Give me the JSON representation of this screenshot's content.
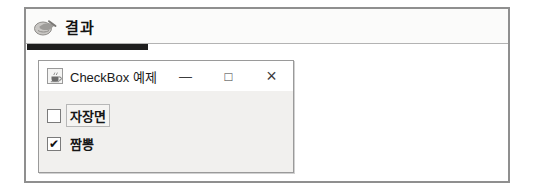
{
  "panel": {
    "header": {
      "icon": "writing-hand-icon",
      "title": "결과"
    },
    "accent_bar_color": "#1e1e1e",
    "border_color": "#8f8f8f",
    "divider_color": "#b3b3b3"
  },
  "window": {
    "icon": "java-coffee-cup-icon",
    "title": "CheckBox 예제",
    "titlebar_background": "#ffffff",
    "controls": {
      "minimize": "—",
      "maximize": "□",
      "close": "×"
    },
    "content": {
      "background": "#f1f0ee",
      "check_glyph": "✔",
      "checkboxes": [
        {
          "label": "자장면",
          "checked": false,
          "focused": true
        },
        {
          "label": "짬뽕",
          "checked": true,
          "focused": false
        }
      ]
    }
  }
}
